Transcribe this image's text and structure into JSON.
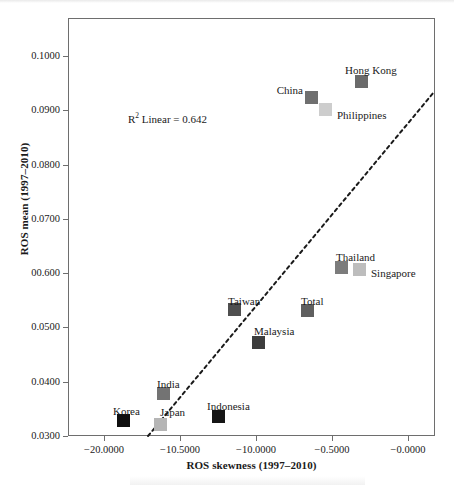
{
  "figure": {
    "annotation": {
      "r2_prefix": "R",
      "r2_exponent": "2",
      "r2_suffix": " Linear = 0.642"
    }
  },
  "chart_data": {
    "type": "scatter",
    "title": "",
    "xlabel": "ROS skewness (1997–2010)",
    "ylabel": "ROS mean (1997–2010)",
    "xlim": [
      -22.0,
      0.0
    ],
    "ylim": [
      0.03,
      0.106
    ],
    "grid": false,
    "legend": "none",
    "annotations": [
      "R² Linear = 0.642"
    ],
    "xticks": [
      {
        "label": "−20.0000",
        "value": -20.0
      },
      {
        "label": "−10.5000",
        "value": -15.5
      },
      {
        "label": "−10.0000",
        "value": -10.0
      },
      {
        "label": "−0.5000",
        "value": -5.0
      },
      {
        "label": "−0.0000",
        "value": 0.0
      }
    ],
    "yticks": [
      {
        "label": "0.1000",
        "value": 0.1
      },
      {
        "label": "0.0900",
        "value": 0.09
      },
      {
        "label": "0.0800",
        "value": 0.08
      },
      {
        "label": "0.0700",
        "value": 0.07
      },
      {
        "label": "00.600",
        "value": 0.06
      },
      {
        "label": "0.0500",
        "value": 0.05
      },
      {
        "label": "0.0400",
        "value": 0.04
      },
      {
        "label": "0.0300",
        "value": 0.03
      }
    ],
    "points": [
      {
        "name": "Hong Kong",
        "x": -3.45,
        "y": 0.0942,
        "color": "#6b6b6b",
        "px": 361,
        "py": 81,
        "label_x": 345,
        "label_y": 65,
        "label_align": "left"
      },
      {
        "name": "China",
        "x": -6.45,
        "y": 0.0914,
        "color": "#6f6f6f",
        "px": 311,
        "py": 97,
        "label_x": 303,
        "label_y": 85,
        "label_align": "right"
      },
      {
        "name": "Philippines",
        "x": -5.65,
        "y": 0.0896,
        "color": "#cdcdcd",
        "px": 325,
        "py": 109,
        "label_x": 337,
        "label_y": 110,
        "label_align": "left"
      },
      {
        "name": "Thailand",
        "x": -4.75,
        "y": 0.0616,
        "color": "#7c7c7c",
        "px": 341,
        "py": 267,
        "label_x": 336,
        "label_y": 252,
        "label_align": "left"
      },
      {
        "name": "Singapore",
        "x": -3.65,
        "y": 0.0612,
        "color": "#bdbdbd",
        "px": 359,
        "py": 269,
        "label_x": 371,
        "label_y": 268,
        "label_align": "left"
      },
      {
        "name": "Taiwan",
        "x": -11.1,
        "y": 0.0536,
        "color": "#4f4f4f",
        "px": 234,
        "py": 309,
        "label_x": 228,
        "label_y": 296,
        "label_align": "left"
      },
      {
        "name": "Total",
        "x": -6.7,
        "y": 0.0534,
        "color": "#5f5f5f",
        "px": 307,
        "py": 310,
        "label_x": 301,
        "label_y": 296,
        "label_align": "left"
      },
      {
        "name": "Malaysia",
        "x": -9.6,
        "y": 0.0482,
        "color": "#3d3d3d",
        "px": 258,
        "py": 342,
        "label_x": 254,
        "label_y": 326,
        "label_align": "left"
      },
      {
        "name": "India",
        "x": -15.3,
        "y": 0.0388,
        "color": "#737373",
        "px": 163,
        "py": 393,
        "label_x": 157,
        "label_y": 379,
        "label_align": "left"
      },
      {
        "name": "Indonesia",
        "x": -12.0,
        "y": 0.0344,
        "color": "#151515",
        "px": 218,
        "py": 416,
        "label_x": 207,
        "label_y": 401,
        "label_align": "left"
      },
      {
        "name": "Korea",
        "x": -17.7,
        "y": 0.0336,
        "color": "#0f0f0f",
        "px": 123,
        "py": 420,
        "label_x": 113,
        "label_y": 406,
        "label_align": "left"
      },
      {
        "name": "Japan",
        "x": -15.45,
        "y": 0.033,
        "color": "#b5b5b5",
        "px": 160,
        "py": 424,
        "label_x": 160,
        "label_y": 407,
        "label_align": "left"
      }
    ],
    "fit_line": {
      "style": "dashed",
      "color": "#1a1a1a",
      "x1_px": 148,
      "y1_px": 436,
      "x2_px": 434,
      "y2_px": 92
    }
  }
}
